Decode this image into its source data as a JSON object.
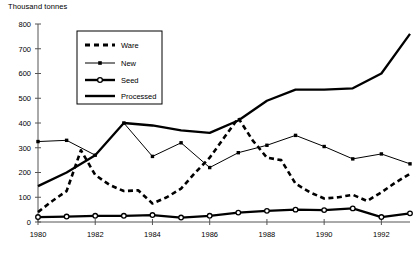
{
  "chart_data": {
    "type": "line",
    "title": "Thousand tonnes",
    "xlabel": "",
    "ylabel": "Thousand tonnes",
    "ylim": [
      0,
      800
    ],
    "xlim": [
      1980,
      1993
    ],
    "ytick_step": 100,
    "xtick_step": 2,
    "grid": false,
    "legend_position": "top-left-inside",
    "yticks": [
      "0",
      "100",
      "200",
      "300",
      "400",
      "500",
      "600",
      "700",
      "800"
    ],
    "xticks": [
      "1980",
      "1982",
      "1984",
      "1986",
      "1988",
      "1990",
      "1992"
    ],
    "x": [
      1980,
      1981,
      1982,
      1983,
      1984,
      1985,
      1986,
      1987,
      1988,
      1989,
      1990,
      1991,
      1992,
      1993
    ],
    "series": [
      {
        "name": "Ware",
        "style": "dashed-thick",
        "marker": "none",
        "color": "#000000",
        "values": [
          40,
          125,
          190,
          125,
          75,
          135,
          260,
          420,
          260,
          155,
          95,
          110,
          120,
          195
        ],
        "x_dense": [
          1980,
          1980.5,
          1981,
          1981.5,
          1982,
          1982.5,
          1983,
          1983.5,
          1984,
          1984.5,
          1985,
          1985.5,
          1986,
          1986.5,
          1987,
          1987.5,
          1988,
          1988.5,
          1989,
          1989.5,
          1990,
          1990.5,
          1991,
          1991.5,
          1992,
          1992.5,
          1993
        ],
        "values_dense": [
          40,
          85,
          125,
          290,
          190,
          150,
          125,
          128,
          75,
          100,
          135,
          200,
          260,
          340,
          420,
          330,
          260,
          250,
          155,
          120,
          95,
          100,
          110,
          85,
          120,
          160,
          195
        ]
      },
      {
        "name": "New",
        "style": "solid-thin",
        "marker": "square-filled",
        "color": "#000000",
        "values": [
          325,
          330,
          270,
          400,
          265,
          320,
          220,
          280,
          310,
          350,
          305,
          255,
          275,
          235
        ]
      },
      {
        "name": "Seed",
        "style": "solid-thick",
        "marker": "circle-open",
        "color": "#000000",
        "values": [
          20,
          22,
          25,
          25,
          28,
          18,
          25,
          38,
          45,
          50,
          48,
          55,
          20,
          35
        ]
      },
      {
        "name": "Processed",
        "style": "solid-thick",
        "marker": "none",
        "color": "#000000",
        "values": [
          145,
          200,
          270,
          400,
          390,
          370,
          360,
          410,
          490,
          535,
          535,
          540,
          600,
          760
        ]
      }
    ]
  },
  "legend": {
    "entries": [
      {
        "label": "Ware"
      },
      {
        "label": "New"
      },
      {
        "label": "Seed"
      },
      {
        "label": "Processed"
      }
    ]
  }
}
